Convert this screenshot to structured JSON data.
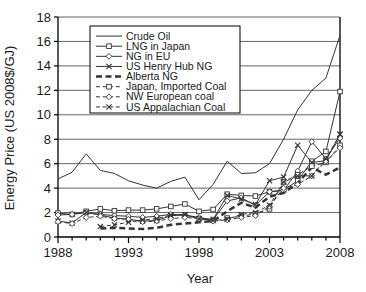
{
  "chart_data": {
    "type": "line",
    "title": "",
    "xlabel": "Year",
    "ylabel": "Energy Price (US 2008$/GJ)",
    "xlim": [
      1988,
      2008
    ],
    "ylim": [
      0,
      18
    ],
    "ytick_labels": [
      "0",
      "2",
      "4",
      "6",
      "8",
      "10",
      "12",
      "14",
      "16",
      "18"
    ],
    "yticks": [
      0,
      2,
      4,
      6,
      8,
      10,
      12,
      14,
      16,
      18
    ],
    "xtick_labels": [
      "1988",
      "1993",
      "1998",
      "2003",
      "2008"
    ],
    "xticks": [
      1988,
      1993,
      1998,
      2003,
      2008
    ],
    "x_minor_tick_step": 1,
    "grid": "horizontal",
    "legend_position": "upper-left-inside",
    "x": [
      1988,
      1989,
      1990,
      1991,
      1992,
      1993,
      1994,
      1995,
      1996,
      1997,
      1998,
      1999,
      2000,
      2001,
      2002,
      2003,
      2004,
      2005,
      2006,
      2007,
      2008
    ],
    "series": [
      {
        "name": "Crude Oil",
        "marker": "none",
        "dash": "solid",
        "width": 1,
        "values": [
          4.75,
          5.3,
          6.8,
          5.45,
          5.2,
          4.6,
          4.25,
          4.0,
          4.55,
          4.9,
          3.05,
          4.3,
          6.2,
          5.2,
          5.25,
          6.0,
          8.0,
          10.4,
          12.0,
          13.0,
          16.5
        ]
      },
      {
        "name": "LNG in Japan",
        "marker": "square",
        "dash": "solid",
        "width": 1,
        "values": [
          1.95,
          1.85,
          2.1,
          2.3,
          2.15,
          2.2,
          2.2,
          2.3,
          2.5,
          2.7,
          2.1,
          2.25,
          3.5,
          3.4,
          3.35,
          3.7,
          3.85,
          4.6,
          6.2,
          7.0,
          11.9
        ]
      },
      {
        "name": "NG in EU",
        "marker": "diamond",
        "dash": "solid",
        "width": 1,
        "values": [
          1.8,
          1.85,
          2.0,
          1.85,
          1.75,
          1.7,
          1.6,
          1.7,
          1.85,
          1.8,
          1.6,
          1.4,
          2.95,
          3.2,
          2.6,
          3.7,
          3.8,
          5.4,
          7.8,
          6.4,
          8.1
        ]
      },
      {
        "name": "US Henry Hub NG",
        "marker": "cross",
        "dash": "solid",
        "width": 1,
        "values": [
          1.3,
          1.15,
          2.0,
          1.8,
          1.55,
          1.45,
          1.3,
          1.35,
          1.75,
          1.8,
          1.5,
          1.45,
          3.4,
          3.1,
          2.65,
          4.6,
          4.9,
          7.5,
          6.1,
          6.25,
          8.4
        ]
      },
      {
        "name": "Alberta NG",
        "marker": "none",
        "dash": "thick-dash",
        "width": 2.5,
        "values": [
          null,
          null,
          null,
          0.7,
          0.75,
          0.7,
          0.65,
          0.75,
          1.0,
          1.1,
          1.2,
          1.3,
          2.1,
          2.8,
          2.4,
          3.3,
          3.6,
          4.4,
          5.7,
          5.1,
          5.7
        ]
      },
      {
        "name": "Japan, Imported Coal",
        "marker": "square",
        "dash": "dashed",
        "width": 1,
        "values": [
          null,
          null,
          null,
          null,
          null,
          null,
          null,
          null,
          null,
          null,
          null,
          null,
          1.55,
          1.7,
          1.9,
          2.3,
          4.5,
          5.1,
          5.8,
          6.1,
          7.5
        ]
      },
      {
        "name": "NW European coal",
        "marker": "diamond",
        "dash": "dashed",
        "width": 1,
        "values": [
          1.25,
          1.1,
          1.6,
          1.7,
          1.5,
          1.45,
          1.25,
          1.3,
          1.5,
          1.6,
          1.5,
          1.3,
          1.4,
          1.6,
          1.75,
          2.5,
          4.0,
          4.3,
          5.0,
          6.2,
          7.3
        ]
      },
      {
        "name": "US Appalachian Coal",
        "marker": "cross",
        "dash": "dashed",
        "width": 1,
        "values": [
          null,
          null,
          null,
          0.85,
          1.0,
          1.2,
          1.4,
          1.5,
          1.8,
          1.85,
          1.5,
          1.35,
          1.45,
          1.85,
          2.0,
          2.6,
          4.5,
          5.0,
          5.0,
          6.4,
          8.4
        ]
      }
    ]
  },
  "legend": {
    "items": [
      {
        "label": "Crude Oil"
      },
      {
        "label": "LNG in Japan"
      },
      {
        "label": "NG in EU"
      },
      {
        "label": "US Henry Hub NG"
      },
      {
        "label": "Alberta NG"
      },
      {
        "label": "Japan, Imported Coal"
      },
      {
        "label": "NW European coal"
      },
      {
        "label": "US Appalachian Coal"
      }
    ]
  },
  "colors": {
    "line": "#333333",
    "axis": "#000000",
    "grid": "#555555",
    "background": "#ffffff"
  }
}
